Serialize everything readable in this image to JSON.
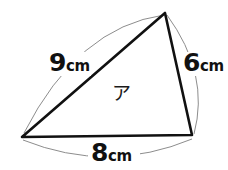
{
  "figure": {
    "type": "triangle-with-labeled-sides",
    "background_color": "#ffffff",
    "stroke_color": "#111111",
    "arc_color": "#8a8a8a",
    "vertices": {
      "apex": {
        "x": 165,
        "y": 13
      },
      "left": {
        "x": 22,
        "y": 137
      },
      "right": {
        "x": 192,
        "y": 135
      }
    },
    "sides": [
      {
        "id": "side-a",
        "from": "left",
        "to": "apex",
        "number": "9",
        "unit": "cm",
        "full_label": "9cm"
      },
      {
        "id": "side-b",
        "from": "apex",
        "to": "right",
        "number": "6",
        "unit": "cm",
        "full_label": "6cm"
      },
      {
        "id": "side-c",
        "from": "left",
        "to": "right",
        "number": "8",
        "unit": "cm",
        "full_label": "8cm"
      }
    ],
    "region": {
      "id": "region-interior",
      "label": "ア"
    },
    "arcs": [
      {
        "id": "arc-a",
        "side": "side-a",
        "bulge": "outward-up-left"
      },
      {
        "id": "arc-b",
        "side": "side-b",
        "bulge": "outward-right"
      },
      {
        "id": "arc-c",
        "side": "side-c",
        "bulge": "outward-down"
      }
    ]
  }
}
